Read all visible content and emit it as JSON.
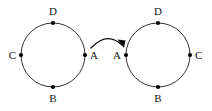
{
  "figure": {
    "background_color": "#ffffff",
    "stroke_color": "#1a1a1a",
    "label_color": "#141414",
    "dot_color": "#000000"
  },
  "diagram": {
    "type": "two-cycle-mapping-diagram",
    "circles": [
      {
        "id": "left-circle",
        "center_x": 53,
        "center_y": 55,
        "radius": 32,
        "nodes": [
          {
            "id": "left-node-d",
            "label": "D",
            "angle_deg": 270,
            "dot_x": 53,
            "dot_y": 23,
            "label_x": 53,
            "label_y": 12,
            "label_anchor": "middle"
          },
          {
            "id": "left-node-a",
            "label": "A",
            "angle_deg": 0,
            "dot_x": 85,
            "dot_y": 55,
            "label_x": 90,
            "label_y": 55,
            "label_anchor": "start"
          },
          {
            "id": "left-node-b",
            "label": "B",
            "angle_deg": 90,
            "dot_x": 53,
            "dot_y": 87,
            "label_x": 53,
            "label_y": 98,
            "label_anchor": "middle"
          },
          {
            "id": "left-node-c",
            "label": "C",
            "angle_deg": 180,
            "dot_x": 21,
            "dot_y": 55,
            "label_x": 16,
            "label_y": 55,
            "label_anchor": "end"
          }
        ]
      },
      {
        "id": "right-circle",
        "center_x": 158,
        "center_y": 55,
        "radius": 32,
        "nodes": [
          {
            "id": "right-node-d",
            "label": "D",
            "angle_deg": 270,
            "dot_x": 158,
            "dot_y": 23,
            "label_x": 158,
            "label_y": 12,
            "label_anchor": "middle"
          },
          {
            "id": "right-node-c",
            "label": "C",
            "angle_deg": 0,
            "dot_x": 190,
            "dot_y": 55,
            "label_x": 195,
            "label_y": 55,
            "label_anchor": "start"
          },
          {
            "id": "right-node-b",
            "label": "B",
            "angle_deg": 90,
            "dot_x": 158,
            "dot_y": 87,
            "label_x": 158,
            "label_y": 98,
            "label_anchor": "middle"
          },
          {
            "id": "right-node-a",
            "label": "A",
            "angle_deg": 180,
            "dot_x": 126,
            "dot_y": 55,
            "label_x": 121,
            "label_y": 55,
            "label_anchor": "end"
          }
        ]
      }
    ],
    "arrow": {
      "id": "mapping-arrow",
      "from": "left-node-a",
      "to": "right-node-a",
      "path": "M 91 48 Q 107 31 122 45",
      "head_points": "122,45 119,38 126,41",
      "dot_radius": 2.1
    }
  }
}
